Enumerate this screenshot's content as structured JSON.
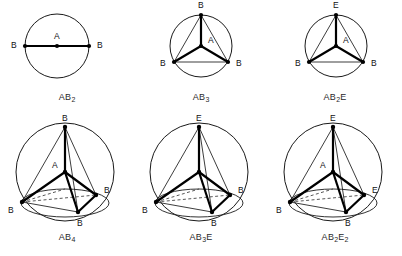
{
  "page": {
    "background_color": "#ffffff",
    "ink_color": "#1a1a1a"
  },
  "figures": [
    {
      "id": "ab2",
      "caption_formula": "AB",
      "caption_sub": "2",
      "caption_full": "AB2",
      "shape_name": "linear",
      "boundary": "circle",
      "center_label": "A",
      "vertex_labels": [
        "B",
        "B"
      ],
      "bond_count": 2,
      "lone_pairs": 0
    },
    {
      "id": "ab3",
      "caption_formula": "AB",
      "caption_sub": "3",
      "caption_full": "AB3",
      "shape_name": "trigonal-planar",
      "boundary": "circle",
      "center_label": "A",
      "vertex_labels": [
        "B",
        "B",
        "B"
      ],
      "bond_count": 3,
      "lone_pairs": 0
    },
    {
      "id": "ab2e",
      "caption_formula": "AB",
      "caption_sub": "2",
      "caption_tail": "E",
      "caption_full": "AB2E",
      "shape_name": "bent",
      "boundary": "circle",
      "center_label": "A",
      "vertex_labels": [
        "E",
        "B",
        "B"
      ],
      "bond_count": 2,
      "lone_pairs": 1
    },
    {
      "id": "ab4",
      "caption_formula": "AB",
      "caption_sub": "4",
      "caption_full": "AB4",
      "shape_name": "tetrahedral",
      "boundary": "sphere",
      "center_label": "A",
      "vertex_labels": [
        "B",
        "B",
        "B",
        "B"
      ],
      "bond_count": 4,
      "lone_pairs": 0
    },
    {
      "id": "ab3e",
      "caption_formula": "AB",
      "caption_sub": "3",
      "caption_tail": "E",
      "caption_full": "AB3E",
      "shape_name": "trigonal-pyramidal",
      "boundary": "sphere",
      "center_label": "A",
      "vertex_labels": [
        "E",
        "B",
        "B",
        "B"
      ],
      "bond_count": 3,
      "lone_pairs": 1
    },
    {
      "id": "ab2e2",
      "caption_formula": "AB",
      "caption_sub": "2",
      "caption_tail": "E",
      "caption_tail_sub": "2",
      "caption_full": "AB2E2",
      "shape_name": "bent-tetrahedral",
      "boundary": "sphere",
      "center_label": "A",
      "vertex_labels": [
        "E",
        "E",
        "B",
        "B"
      ],
      "bond_count": 2,
      "lone_pairs": 2
    }
  ],
  "labels": {
    "ab2": {
      "center": "A",
      "left_vertex": "B",
      "right_vertex": "B"
    },
    "ab3": {
      "center": "A",
      "top_vertex": "B",
      "left_vertex": "B",
      "right_vertex": "B"
    },
    "ab2e": {
      "center": "A",
      "top_vertex": "E",
      "left_vertex": "B",
      "right_vertex": "B"
    },
    "ab4": {
      "center": "A",
      "apex_vertex": "B",
      "left_vertex": "B",
      "right_vertex": "B",
      "front_vertex": "B"
    },
    "ab3e": {
      "center": "A",
      "apex_vertex": "E",
      "left_vertex": "B",
      "right_vertex": "B",
      "front_vertex": "B"
    },
    "ab2e2": {
      "center": "A",
      "apex_vertex": "E",
      "left_vertex": "B",
      "right_vertex": "E",
      "front_vertex": "B"
    }
  }
}
